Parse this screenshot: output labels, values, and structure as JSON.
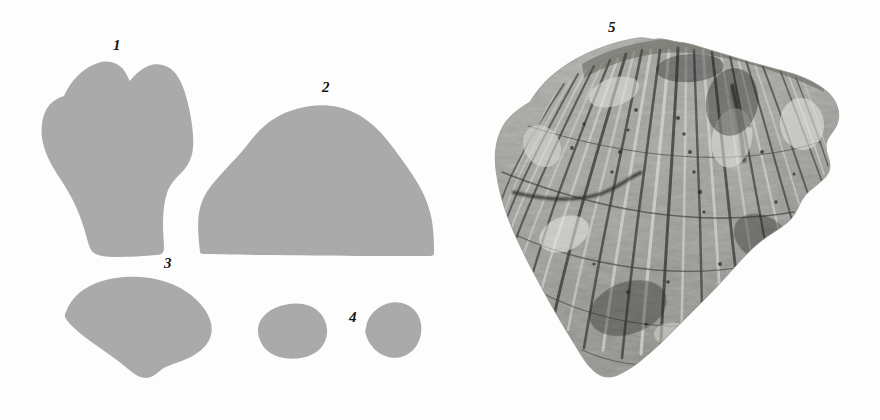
{
  "plate": {
    "title": "",
    "background_color": "#fdfdfd",
    "width": 880,
    "height": 420,
    "silhouette_color": "#aaaaaa",
    "label_color": "#141414"
  },
  "specimens": [
    {
      "number": "1",
      "label": "1",
      "kind": "silhouette",
      "description": "tooth-shaped / shield-like outline, widest at top with notched crown, tapering to a narrower flat base",
      "label_x": 113,
      "label_y": 38,
      "bbox": {
        "x": 40,
        "y": 55,
        "w": 160,
        "h": 200
      }
    },
    {
      "number": "2",
      "label": "2",
      "kind": "silhouette",
      "description": "broad dome / arch outline with flat horizontal base",
      "label_x": 322,
      "label_y": 80,
      "bbox": {
        "x": 198,
        "y": 98,
        "w": 236,
        "h": 156
      }
    },
    {
      "number": "3",
      "label": "3",
      "kind": "silhouette",
      "description": "fan / rounded-triangular outline, rounded broad top tapering to a blunt point at the bottom",
      "label_x": 164,
      "label_y": 256,
      "bbox": {
        "x": 62,
        "y": 276,
        "w": 160,
        "h": 100
      }
    },
    {
      "number": "4",
      "label": "4",
      "kind": "silhouette-pair",
      "description": "two small rounded oval outlines side by side",
      "label_x": 349,
      "label_y": 310,
      "bbox": {
        "x": 258,
        "y": 303,
        "w": 160,
        "h": 56
      }
    },
    {
      "number": "5",
      "label": "5",
      "kind": "photograph",
      "description": "grayscale photograph of a fan-shaped fossil fragment with dense radiating vertical ridges and striations, broken irregular margins",
      "label_x": 608,
      "label_y": 20,
      "bbox": {
        "x": 440,
        "y": 36,
        "w": 420,
        "h": 380
      }
    }
  ]
}
